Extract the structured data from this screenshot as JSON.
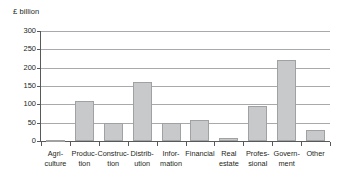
{
  "chart_data": {
    "type": "bar",
    "title": "",
    "subtitle": "",
    "unit_label": "£ billion",
    "xlabel": "",
    "ylabel": "£ billion",
    "ylim": [
      0,
      300
    ],
    "yticks": [
      0,
      50,
      100,
      150,
      200,
      250,
      300
    ],
    "ytick_labels": [
      "0",
      "50",
      "100",
      "150",
      "200",
      "250",
      "300"
    ],
    "grid": true,
    "legend": false,
    "legend_position": "none",
    "bar_color": "#c8c9ca",
    "bar_border_color": "#a0a1a3",
    "axis_color": "#58595b",
    "gridline_color": "#a7a9ac",
    "text_color": "#231f20",
    "categories": [
      "Agri-\nculture",
      "Produc-\ntion",
      "Construc-\ntion",
      "Distrib-\nution",
      "Infor-\nmation",
      "Financial",
      "Real\nestate",
      "Profes-\nsional",
      "Govern-\nment",
      "Other"
    ],
    "category_names": [
      "Agriculture",
      "Production",
      "Construction",
      "Distribution",
      "Information",
      "Financial",
      "Real estate",
      "Professional",
      "Government",
      "Other"
    ],
    "values": [
      3,
      108,
      48,
      161,
      49,
      56,
      7,
      96,
      221,
      31
    ]
  }
}
